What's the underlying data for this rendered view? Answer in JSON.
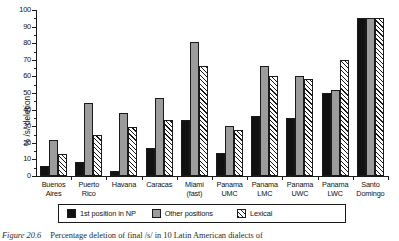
{
  "chart_data": {
    "type": "bar",
    "title": "",
    "xlabel": "",
    "ylabel": "% /s/ deletion",
    "ylim": [
      0,
      100
    ],
    "yticks": [
      0,
      10,
      20,
      30,
      40,
      50,
      60,
      70,
      80,
      90,
      100
    ],
    "grid": false,
    "legend_position": "bottom",
    "categories": [
      "Buenos Aires",
      "Puerto Rico",
      "Havana",
      "Caracas",
      "Miami (fast)",
      "Panama UMC",
      "Panama LMC",
      "Panama UWC",
      "Panama LWC",
      "Santo Domingo"
    ],
    "category_lines": [
      [
        "Buenos",
        "Aires"
      ],
      [
        "Puerto",
        "Rico"
      ],
      [
        "Havana",
        ""
      ],
      [
        "Caracas",
        ""
      ],
      [
        "Miami",
        "(fast)"
      ],
      [
        "Panama",
        "UMC"
      ],
      [
        "Panama",
        "LMC"
      ],
      [
        "Panama",
        "UWC"
      ],
      [
        "Panama",
        "LWC"
      ],
      [
        "Santo",
        "Domingo"
      ]
    ],
    "series": [
      {
        "name": "1st position in NP",
        "style": "solid-black",
        "values": [
          6,
          8.5,
          3,
          17,
          34,
          14,
          36,
          35,
          50,
          95
        ]
      },
      {
        "name": "Other positions",
        "style": "dotted-gray",
        "values": [
          21.5,
          44,
          38,
          47,
          81,
          30,
          66,
          60,
          52,
          95
        ]
      },
      {
        "name": "Lexical",
        "style": "diagonal-hatch",
        "values": [
          13,
          25,
          29.5,
          34,
          66,
          28,
          60,
          58.5,
          70,
          95
        ]
      }
    ]
  },
  "legend": {
    "items": [
      {
        "label": "1st position in NP",
        "swatch": "solid-black-swatch"
      },
      {
        "label": "Other positions",
        "swatch": "dotted-gray-swatch"
      },
      {
        "label": "Lexical",
        "swatch": "diagonal-hatch-swatch"
      }
    ]
  },
  "caption": {
    "label": "Figure 20.6",
    "text": "Percentage deletion of final /s/ in 10 Latin American dialects of"
  }
}
